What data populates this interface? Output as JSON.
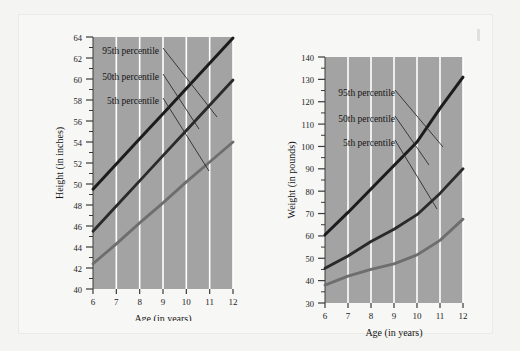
{
  "figure": {
    "background_color": "#f7f7f5",
    "page_color": "#f3f3f1",
    "plot_color": "#a3a3a3",
    "gridline_color": "#ffffff",
    "axis_color": "#3a3a3a"
  },
  "charts": [
    {
      "id": "height-chart",
      "chart_data": {
        "type": "line",
        "title": "",
        "xlabel": "Age (in years)",
        "ylabel": "Height (in inches)",
        "x": [
          6,
          7,
          8,
          9,
          10,
          11,
          12
        ],
        "xlim": [
          6,
          12
        ],
        "ylim": [
          40,
          64
        ],
        "xticks": [
          "6",
          "7",
          "8",
          "9",
          "10",
          "11",
          "12"
        ],
        "yticks": [
          "40",
          "42",
          "44",
          "46",
          "48",
          "50",
          "52",
          "54",
          "56",
          "58",
          "60",
          "62",
          "64"
        ],
        "grid": "vertical",
        "legend_position": "inline-annotations",
        "series": [
          {
            "name": "95th percentile",
            "color": "#1c1c1c",
            "width": 3.0,
            "values": [
              49.5,
              51.9,
              54.3,
              56.7,
              59.1,
              61.5,
              63.9
            ]
          },
          {
            "name": "50th percentile",
            "color": "#2a2a2a",
            "width": 2.8,
            "values": [
              45.5,
              47.9,
              50.3,
              52.7,
              55.1,
              57.5,
              59.9
            ]
          },
          {
            "name": "5th percentile",
            "color": "#6e6e6e",
            "width": 2.8,
            "values": [
              42.4,
              44.3,
              46.3,
              48.2,
              50.2,
              52.1,
              54.0
            ]
          }
        ],
        "annotations": [
          {
            "text": "95th percentile",
            "series": "95th percentile"
          },
          {
            "text": "50th percentile",
            "series": "50th percentile"
          },
          {
            "text": "5th percentile",
            "series": "5th percentile"
          }
        ]
      }
    },
    {
      "id": "weight-chart",
      "chart_data": {
        "type": "line",
        "title": "",
        "xlabel": "Age (in years)",
        "ylabel": "Weight (in pounds)",
        "x": [
          6,
          7,
          8,
          9,
          10,
          11,
          12
        ],
        "xlim": [
          6,
          12
        ],
        "ylim": [
          30,
          140
        ],
        "xticks": [
          "6",
          "7",
          "8",
          "9",
          "10",
          "11",
          "12"
        ],
        "yticks": [
          "30",
          "40",
          "50",
          "60",
          "70",
          "80",
          "90",
          "100",
          "110",
          "120",
          "130",
          "140"
        ],
        "grid": "vertical",
        "legend_position": "inline-annotations",
        "series": [
          {
            "name": "95th percentile",
            "color": "#1c1c1c",
            "width": 3.0,
            "values": [
              60.5,
              70.5,
              81.0,
              91.5,
              102.0,
              117.0,
              131.0
            ]
          },
          {
            "name": "50th percentile",
            "color": "#2a2a2a",
            "width": 2.8,
            "values": [
              45.5,
              51.0,
              57.5,
              63.0,
              69.5,
              79.0,
              90.0
            ]
          },
          {
            "name": "5th percentile",
            "color": "#6e6e6e",
            "width": 2.8,
            "values": [
              38.0,
              42.0,
              45.0,
              47.5,
              51.5,
              58.0,
              67.5
            ]
          }
        ],
        "annotations": [
          {
            "text": "95th percentile",
            "series": "95th percentile"
          },
          {
            "text": "50th percentile",
            "series": "50th percentile"
          },
          {
            "text": "5th percentile",
            "series": "5th percentile"
          }
        ]
      }
    }
  ]
}
